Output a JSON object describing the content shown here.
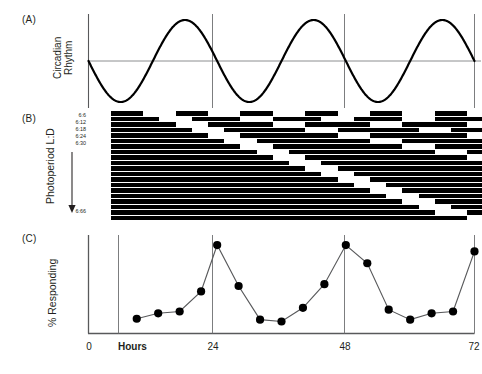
{
  "figure": {
    "panels": [
      {
        "id": "A",
        "label": "(A)",
        "ylabel": "Circadian\nRhythm"
      },
      {
        "id": "B",
        "label": "(B)",
        "ylabel": "Photoperiod L:D"
      },
      {
        "id": "C",
        "label": "(C)",
        "ylabel": "% Responding"
      }
    ],
    "panel_a_label": "(A)",
    "panel_b_label": "(B)",
    "panel_c_label": "(C)",
    "ylabel_a": "Circadian Rhythm",
    "ylabel_a_line1": "Circadian",
    "ylabel_a_line2": "Rhythm",
    "ylabel_b": "Photoperiod L:D",
    "ylabel_c": "% Responding",
    "hours_word": "Hours",
    "photoperiod_top_ticks": "6:6\n6:12\n6:18\n6:24\n6:30",
    "photoperiod_bottom_tick": "6:66",
    "photoperiod_ticks_top": [
      "6:6",
      "6:12",
      "6:18",
      "6:24",
      "6:30"
    ],
    "photoperiod_ticks_bottom": [
      "6:66"
    ],
    "x_tick_labels": [
      "0",
      "24",
      "48",
      "72"
    ],
    "colors": {
      "ink": "#231f20",
      "dark_phase": "#000000",
      "light_phase": "#ffffff",
      "gridline": "#6d6e71",
      "axis": "#58595b",
      "marker": "#000000",
      "curve": "#000000",
      "background": "#ffffff"
    }
  },
  "chart_data": [
    {
      "id": "panel-a",
      "type": "line",
      "title": "(A) Circadian Rhythm",
      "xlabel": "",
      "ylabel": "Circadian Rhythm",
      "xlim": [
        0,
        72
      ],
      "ylim": [
        -1,
        1
      ],
      "grid": true,
      "gridlines_x": [
        24,
        48,
        72
      ],
      "zero_line": 0,
      "waveform": "sine",
      "period_hours": 24,
      "phase": "starts at zero descending",
      "amplitude": 1,
      "description": "Three complete circadian cycles across 72 hours; trough near 6 h, peak near 18 h of each cycle.",
      "x": [
        0,
        1,
        2,
        3,
        4,
        5,
        6,
        7,
        8,
        9,
        10,
        11,
        12,
        13,
        14,
        15,
        16,
        17,
        18,
        19,
        20,
        21,
        22,
        23,
        24,
        25,
        26,
        27,
        28,
        29,
        30,
        31,
        32,
        33,
        34,
        35,
        36,
        37,
        38,
        39,
        40,
        41,
        42,
        43,
        44,
        45,
        46,
        47,
        48,
        49,
        50,
        51,
        52,
        53,
        54,
        55,
        56,
        57,
        58,
        59,
        60,
        61,
        62,
        63,
        64,
        65,
        66,
        67,
        68,
        69,
        70,
        71,
        72
      ],
      "y": [
        0,
        -0.26,
        -0.5,
        -0.71,
        -0.87,
        -0.97,
        -1,
        -0.97,
        -0.87,
        -0.71,
        -0.5,
        -0.26,
        0,
        0.26,
        0.5,
        0.71,
        0.87,
        0.97,
        1,
        0.97,
        0.87,
        0.71,
        0.5,
        0.26,
        0,
        -0.26,
        -0.5,
        -0.71,
        -0.87,
        -0.97,
        -1,
        -0.97,
        -0.87,
        -0.71,
        -0.5,
        -0.26,
        0,
        0.26,
        0.5,
        0.71,
        0.87,
        0.97,
        1,
        0.97,
        0.87,
        0.71,
        0.5,
        0.26,
        0,
        -0.26,
        -0.5,
        -0.71,
        -0.87,
        -0.97,
        -1,
        -0.97,
        -0.87,
        -0.71,
        -0.5,
        -0.26,
        0,
        0.26,
        0.5,
        0.71,
        0.87,
        0.97,
        1,
        0.97,
        0.87,
        0.71,
        0.5,
        0.26,
        0
      ]
    },
    {
      "id": "panel-b",
      "type": "heatmap",
      "title": "(B) Photoperiod L:D actogram",
      "xlabel": "",
      "ylabel": "Photoperiod L:D",
      "xlim": [
        0,
        72
      ],
      "grid": false,
      "description": "Twenty light/dark regimes, each with 6 h of light followed by a progressively longer dark span, from 6:6 at top to 6:66 at bottom. A white pre-treatment block precedes each cycle train.",
      "light_hours": 6,
      "dark_hours_by_row": [
        6,
        9,
        12,
        15,
        18,
        21,
        24,
        27,
        30,
        33,
        36,
        39,
        42,
        45,
        48,
        51,
        54,
        57,
        60,
        66
      ],
      "row_labels": [
        "6:6",
        "6:9",
        "6:12",
        "6:15",
        "6:18",
        "6:21",
        "6:24",
        "6:27",
        "6:30",
        "6:33",
        "6:36",
        "6:39",
        "6:42",
        "6:45",
        "6:48",
        "6:51",
        "6:54",
        "6:57",
        "6:60",
        "6:66"
      ],
      "n_rows": 20,
      "pre_block_hours": 4
    },
    {
      "id": "panel-c",
      "type": "line",
      "title": "(C) % Responding",
      "xlabel": "Hours",
      "ylabel": "% Responding",
      "xlim": [
        0,
        72
      ],
      "ylim": [
        0,
        100
      ],
      "grid": true,
      "gridlines_x": [
        24,
        48,
        72
      ],
      "markers": "filled circles",
      "description": "Percent responding oscillates with a ~24 h period, peaking sharply at 24, 48 and 72 hours.",
      "x": [
        9,
        13,
        17,
        21,
        24,
        28,
        32,
        36,
        40,
        44,
        48,
        52,
        56,
        60,
        64,
        68,
        72
      ],
      "y": [
        14,
        20,
        22,
        44,
        95,
        50,
        13,
        11,
        26,
        52,
        95,
        75,
        24,
        13,
        20,
        22,
        88
      ],
      "points": [
        {
          "x": 9,
          "y": 14
        },
        {
          "x": 13,
          "y": 20
        },
        {
          "x": 17,
          "y": 22
        },
        {
          "x": 21,
          "y": 44
        },
        {
          "x": 24,
          "y": 95
        },
        {
          "x": 28,
          "y": 50
        },
        {
          "x": 32,
          "y": 13
        },
        {
          "x": 36,
          "y": 11
        },
        {
          "x": 40,
          "y": 26
        },
        {
          "x": 44,
          "y": 52
        },
        {
          "x": 48,
          "y": 95
        },
        {
          "x": 52,
          "y": 75
        },
        {
          "x": 56,
          "y": 24
        },
        {
          "x": 60,
          "y": 13
        },
        {
          "x": 64,
          "y": 20
        },
        {
          "x": 68,
          "y": 22
        },
        {
          "x": 72,
          "y": 88
        }
      ]
    }
  ]
}
